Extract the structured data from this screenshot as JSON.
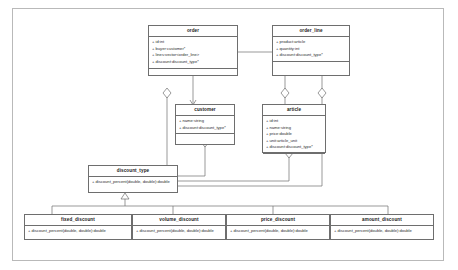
{
  "diagram": {
    "kind": "uml-class-diagram",
    "title": "",
    "line_color": "#6e6e6e",
    "frame_color": "#b9b9b9",
    "background": "#ffffff",
    "text_color": "#2b2b2b"
  },
  "classes": [
    {
      "id": "order",
      "name": "order",
      "attributes": [
        "+ id:int",
        "+ buyer:customer*",
        "+ lines:vector<order_line>",
        "+ discount:discount_type*"
      ],
      "operations": []
    },
    {
      "id": "order_line",
      "name": "order_line",
      "attributes": [
        "+ product:article",
        "+ quantity:int",
        "+ discount:discount_type*"
      ],
      "operations": []
    },
    {
      "id": "customer",
      "name": "customer",
      "attributes": [
        "+ name:string",
        "+ discount:discount_type*"
      ],
      "operations": []
    },
    {
      "id": "article",
      "name": "article",
      "attributes": [
        "+ id:int",
        "+ name:string",
        "+ price:double",
        "+ unit:article_unit",
        "+ discount:discount_type*"
      ],
      "operations": []
    },
    {
      "id": "discount_type",
      "name": "discount_type",
      "attributes": [],
      "operations": [
        "+ discount_percent(double, double):double"
      ]
    },
    {
      "id": "fixed_discount",
      "name": "fixed_discount",
      "attributes": [],
      "operations": [
        "+ discount_percent(double, double):double"
      ]
    },
    {
      "id": "volume_discount",
      "name": "volume_discount",
      "attributes": [],
      "operations": [
        "+ discount_percent(double, double):double"
      ]
    },
    {
      "id": "price_discount",
      "name": "price_discount",
      "attributes": [],
      "operations": [
        "+ discount_percent(double, double):double"
      ]
    },
    {
      "id": "amount_discount",
      "name": "amount_discount",
      "attributes": [],
      "operations": [
        "+ discount_percent(double, double):double"
      ]
    }
  ],
  "relationships": [
    {
      "id": "order-composition-order_line",
      "type": "composition",
      "from": "order",
      "to": "order_line",
      "marker": "filled-diamond"
    },
    {
      "id": "order-association-customer",
      "type": "association",
      "from": "order",
      "to": "customer",
      "marker": "open-arrow"
    },
    {
      "id": "order-aggregation-discount_type",
      "type": "aggregation",
      "from": "order",
      "to": "discount_type",
      "marker": "hollow-diamond"
    },
    {
      "id": "customer-aggregation-discount_type",
      "type": "aggregation",
      "from": "customer",
      "to": "discount_type",
      "marker": "hollow-diamond"
    },
    {
      "id": "article-aggregation-discount_type",
      "type": "aggregation",
      "from": "article",
      "to": "discount_type",
      "marker": "hollow-diamond"
    },
    {
      "id": "order_line-aggregation-article",
      "type": "aggregation",
      "from": "order_line",
      "to": "article",
      "marker": "hollow-diamond"
    },
    {
      "id": "order_line-aggregation-discount_type",
      "type": "aggregation",
      "from": "order_line",
      "to": "discount_type",
      "marker": "hollow-diamond"
    },
    {
      "id": "fixed_discount-generalization-discount_type",
      "type": "generalization",
      "from": "fixed_discount",
      "to": "discount_type",
      "marker": "hollow-triangle"
    },
    {
      "id": "volume_discount-generalization-discount_type",
      "type": "generalization",
      "from": "volume_discount",
      "to": "discount_type",
      "marker": "hollow-triangle"
    },
    {
      "id": "price_discount-generalization-discount_type",
      "type": "generalization",
      "from": "price_discount",
      "to": "discount_type",
      "marker": "hollow-triangle"
    },
    {
      "id": "amount_discount-generalization-discount_type",
      "type": "generalization",
      "from": "amount_discount",
      "to": "discount_type",
      "marker": "hollow-triangle"
    }
  ]
}
